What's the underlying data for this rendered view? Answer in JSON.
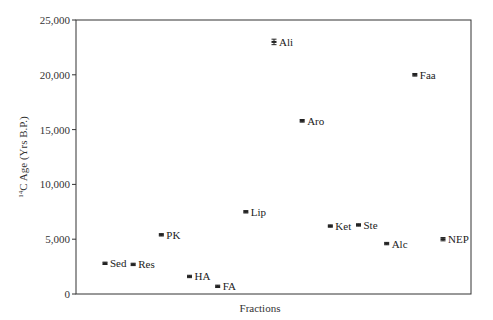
{
  "chart_data": {
    "type": "scatter",
    "title": "",
    "xlabel": "Fractions",
    "ylabel": "14C Age (Yrs B.P.)",
    "ylabel_parts": {
      "sup": "14",
      "rest": "C Age (Yrs B.P.)"
    },
    "ylim": [
      0,
      25000
    ],
    "yticks": [
      0,
      5000,
      10000,
      15000,
      20000,
      25000
    ],
    "ytick_labels": [
      "0",
      "5,000",
      "10,000",
      "15,000",
      "20,000",
      "25,000"
    ],
    "grid": false,
    "legend": null,
    "points": [
      {
        "label": "Sed",
        "order": 1,
        "y": 2800,
        "err": 80
      },
      {
        "label": "Res",
        "order": 2,
        "y": 2700,
        "err": 80
      },
      {
        "label": "PK",
        "order": 3,
        "y": 5400,
        "err": 80
      },
      {
        "label": "HA",
        "order": 4,
        "y": 1600,
        "err": 80
      },
      {
        "label": "FA",
        "order": 5,
        "y": 700,
        "err": 80
      },
      {
        "label": "Lip",
        "order": 6,
        "y": 7500,
        "err": 80
      },
      {
        "label": "Ali",
        "order": 7,
        "y": 23000,
        "err": 250
      },
      {
        "label": "Aro",
        "order": 8,
        "y": 15800,
        "err": 120
      },
      {
        "label": "Ket",
        "order": 9,
        "y": 6200,
        "err": 80
      },
      {
        "label": "Ste",
        "order": 10,
        "y": 6300,
        "err": 80
      },
      {
        "label": "Alc",
        "order": 11,
        "y": 4600,
        "err": 80
      },
      {
        "label": "Faa",
        "order": 12,
        "y": 20000,
        "err": 120
      },
      {
        "label": "NEP",
        "order": 13,
        "y": 5000,
        "err": 150
      }
    ]
  },
  "colors": {
    "axis": "#333333",
    "marker": "#222222",
    "text": "#222222"
  }
}
